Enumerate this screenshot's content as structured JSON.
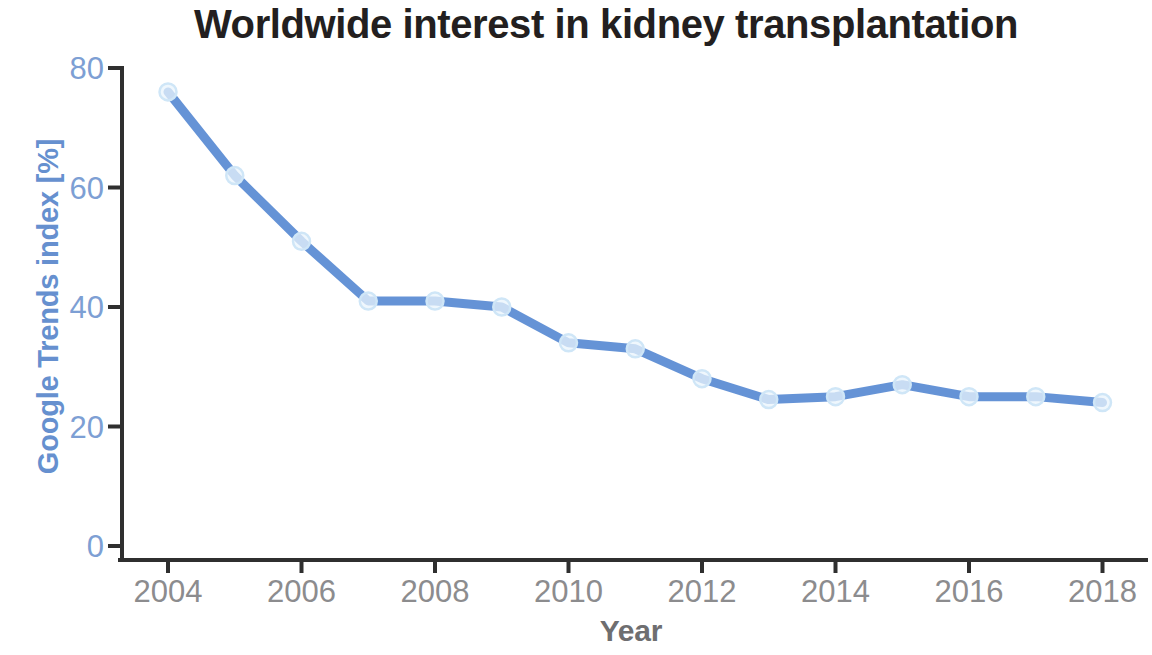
{
  "chart_data": {
    "type": "line",
    "title": "Worldwide interest in kidney transplantation",
    "xlabel": "Year",
    "ylabel": "Google Trends index [%]",
    "x": [
      2004,
      2005,
      2006,
      2007,
      2008,
      2009,
      2010,
      2011,
      2012,
      2013,
      2014,
      2015,
      2016,
      2017,
      2018
    ],
    "values": [
      76,
      62,
      51,
      41,
      41,
      40,
      34,
      33,
      28,
      24.5,
      25,
      27,
      25,
      25,
      24
    ],
    "series": [
      {
        "name": "Google Trends index [%]",
        "values": [
          76,
          62,
          51,
          41,
          41,
          40,
          34,
          33,
          28,
          24.5,
          25,
          27,
          25,
          25,
          24
        ]
      }
    ],
    "xlim": [
      2003.3,
      2018.8
    ],
    "ylim": [
      0,
      80
    ],
    "xticks": [
      2004,
      2006,
      2008,
      2010,
      2012,
      2014,
      2016,
      2018
    ],
    "xtick_labels": [
      "2004",
      "2006",
      "2008",
      "2010",
      "2012",
      "2014",
      "2016",
      "2018"
    ],
    "yticks": [
      0,
      20,
      40,
      60,
      80
    ],
    "ytick_labels": [
      "0",
      "20",
      "40",
      "60",
      "80"
    ],
    "grid": false,
    "legend": "none",
    "markers": "open-circle",
    "colors": {
      "line": "#5d8dd4",
      "marker_fill": "#eaf4fc",
      "marker_stroke": "#cfe6f7",
      "axis": "#2f2f2f",
      "ytick_text": "#7d9fd4",
      "xtick_text": "#8c8c8e",
      "ylabel_text": "#6690cf",
      "xlabel_text": "#6e6e70",
      "title_text": "#231f20",
      "background": "#ffffff"
    }
  }
}
